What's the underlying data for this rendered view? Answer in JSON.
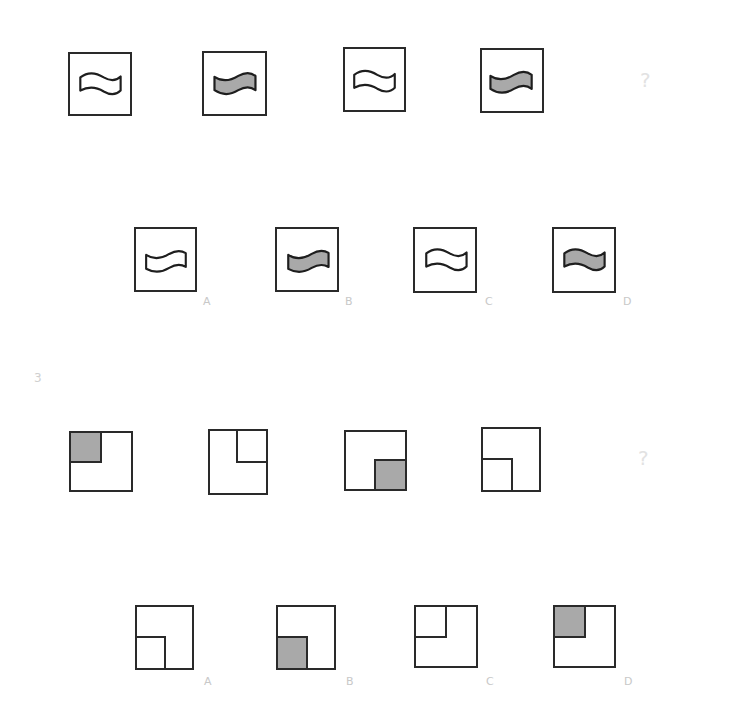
{
  "puzzle1": {
    "sequence": [
      {
        "shape": "wave-flag",
        "fill": "white"
      },
      {
        "shape": "wave-flag",
        "fill": "gray"
      },
      {
        "shape": "wave-flag",
        "fill": "white"
      },
      {
        "shape": "wave-flag",
        "fill": "gray"
      }
    ],
    "question_mark": "?",
    "options": [
      {
        "label": "A",
        "shape": "wave-flag",
        "fill": "white"
      },
      {
        "label": "B",
        "shape": "wave-flag",
        "fill": "gray"
      },
      {
        "label": "C",
        "shape": "wave-flag",
        "fill": "white"
      },
      {
        "label": "D",
        "shape": "wave-flag",
        "fill": "gray"
      }
    ]
  },
  "puzzle2": {
    "number": "3",
    "sequence": [
      {
        "inner_position": "top-left",
        "fill": "gray"
      },
      {
        "inner_position": "top-right",
        "fill": "white"
      },
      {
        "inner_position": "bottom-right",
        "fill": "gray"
      },
      {
        "inner_position": "bottom-left",
        "fill": "white"
      }
    ],
    "question_mark": "?",
    "options": [
      {
        "label": "A",
        "inner_position": "bottom-left",
        "fill": "white"
      },
      {
        "label": "B",
        "inner_position": "bottom-left",
        "fill": "gray"
      },
      {
        "label": "C",
        "inner_position": "top-left",
        "fill": "white"
      },
      {
        "label": "D",
        "inner_position": "top-left",
        "fill": "gray"
      }
    ]
  },
  "colors": {
    "stroke": "#2a2a2a",
    "gray_fill": "#a9a9a9",
    "label": "#c8c8c8"
  }
}
